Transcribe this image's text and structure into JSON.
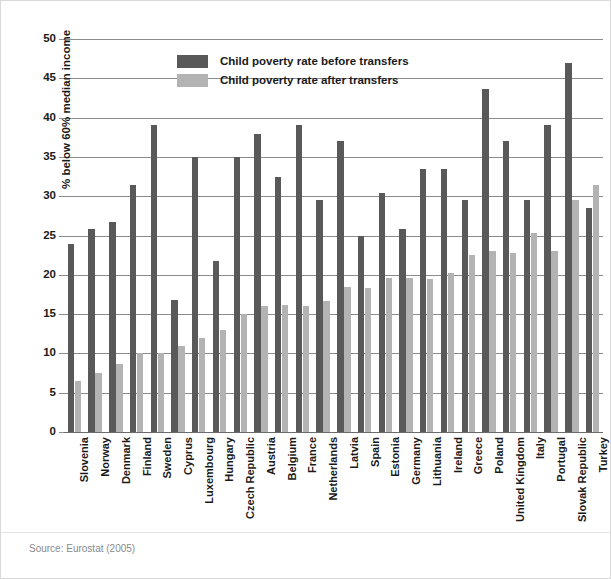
{
  "chart_data": {
    "type": "bar",
    "title": "",
    "xlabel": "",
    "ylabel": "% below 60% median income",
    "ylim": [
      0,
      50
    ],
    "yticks": [
      0,
      5,
      10,
      15,
      20,
      25,
      30,
      35,
      40,
      45,
      50
    ],
    "grid": true,
    "legend_position": "top-center",
    "categories": [
      "Slovenia",
      "Norway",
      "Denmark",
      "Finland",
      "Sweden",
      "Cyprus",
      "Luxembourg",
      "Hungary",
      "Czech Republic",
      "Austria",
      "Belgium",
      "France",
      "Netherlands",
      "Latvia",
      "Spain",
      "Estonia",
      "Germany",
      "Lithuania",
      "Ireland",
      "Greece",
      "Poland",
      "United Kingdom",
      "Italy",
      "Portugal",
      "Slovak Republic",
      "Turkey"
    ],
    "series": [
      {
        "name": "Child poverty rate before transfers",
        "color": "#595959",
        "values": [
          23.9,
          25.8,
          26.7,
          31.4,
          39.0,
          16.8,
          35.0,
          21.8,
          35.0,
          37.9,
          32.4,
          39.0,
          29.5,
          37.0,
          25.0,
          30.4,
          25.8,
          33.4,
          33.4,
          29.5,
          43.7,
          37.0,
          29.5,
          39.0,
          47.0,
          28.5
        ]
      },
      {
        "name": "Child poverty rate after transfers",
        "color": "#b3b3b3",
        "values": [
          6.5,
          7.5,
          8.6,
          10.0,
          10.0,
          11.0,
          12.0,
          13.0,
          15.0,
          16.0,
          16.2,
          16.0,
          16.7,
          18.5,
          18.3,
          19.6,
          19.6,
          19.5,
          20.2,
          22.5,
          23.0,
          22.8,
          25.3,
          23.0,
          29.5,
          31.4
        ]
      }
    ],
    "source": "Source: Eurostat (2005)"
  }
}
